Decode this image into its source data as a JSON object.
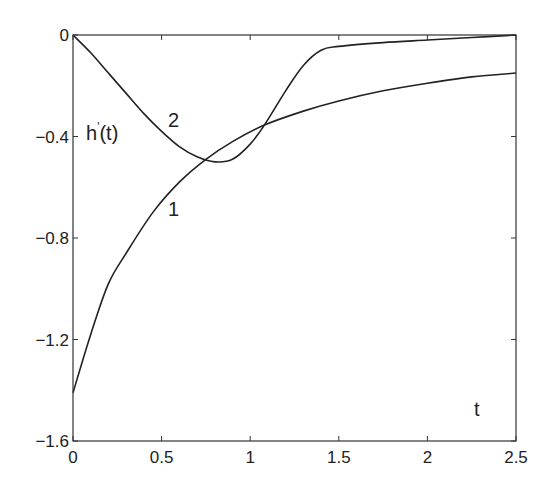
{
  "chart_data": {
    "type": "line",
    "title": "",
    "xlabel": "t",
    "ylabel": "h'(t)",
    "xlim": [
      0,
      2.5
    ],
    "ylim": [
      -1.6,
      0
    ],
    "grid": false,
    "x_ticks": [
      "0",
      "0.5",
      "1",
      "1.5",
      "2",
      "2.5"
    ],
    "y_ticks": [
      "0",
      "-0.4",
      "-0.8",
      "-1.2",
      "-1.6"
    ],
    "series": [
      {
        "name": "1",
        "x": [
          0,
          0.1,
          0.2,
          0.3,
          0.45,
          0.6,
          0.75,
          0.9,
          1.08,
          1.3,
          1.5,
          1.75,
          2.0,
          2.25,
          2.5
        ],
        "y": [
          -1.41,
          -1.18,
          -0.98,
          -0.86,
          -0.7,
          -0.58,
          -0.49,
          -0.42,
          -0.355,
          -0.3,
          -0.26,
          -0.22,
          -0.19,
          -0.165,
          -0.15
        ]
      },
      {
        "name": "2",
        "x": [
          0,
          0.1,
          0.2,
          0.3,
          0.4,
          0.5,
          0.6,
          0.7,
          0.8,
          0.9,
          1.0,
          1.08,
          1.2,
          1.3,
          1.4,
          1.5,
          1.75,
          2.0,
          2.25,
          2.5
        ],
        "y": [
          0,
          -0.07,
          -0.15,
          -0.23,
          -0.31,
          -0.38,
          -0.44,
          -0.48,
          -0.5,
          -0.49,
          -0.43,
          -0.355,
          -0.22,
          -0.12,
          -0.06,
          -0.045,
          -0.03,
          -0.02,
          -0.01,
          0
        ]
      }
    ],
    "annotations": [
      {
        "text": "h'(t)",
        "x": 0.1,
        "y": -0.38
      },
      {
        "text": "2",
        "x": 0.56,
        "y": -0.35
      },
      {
        "text": "1",
        "x": 0.56,
        "y": -0.72
      },
      {
        "text": "t",
        "x": 2.27,
        "y": -1.46
      }
    ]
  },
  "labels": {
    "ylabel_main": "h",
    "ylabel_prime": "'",
    "ylabel_arg": "(t)",
    "xlabel": "t",
    "curve1": "1",
    "curve2": "2"
  }
}
